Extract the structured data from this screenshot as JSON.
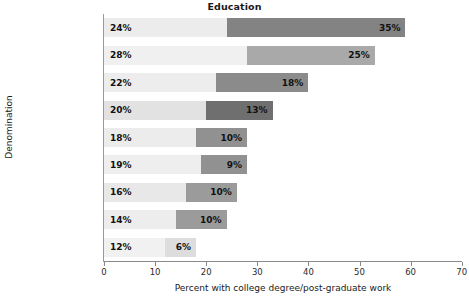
{
  "chart_data": {
    "type": "bar",
    "subtype": "stacked-horizontal",
    "title": "Education",
    "xlabel": "Percent with college degree/post-graduate work",
    "ylabel": "Denomination",
    "xlim": [
      0,
      70
    ],
    "xticks": [
      0,
      10,
      20,
      30,
      40,
      50,
      60,
      70
    ],
    "xtick_labels": [
      "0",
      "10",
      "20",
      "30",
      "40",
      "50",
      "60",
      "70"
    ],
    "grid": false,
    "legend": "none",
    "categories": [
      "Jewish",
      "Episcopalian",
      "Presbyterian",
      "Methodist",
      "Mormon",
      "Lutheran",
      "Roman Catholic",
      "Muslim",
      "Baptist"
    ],
    "series": [
      {
        "name": "College degree",
        "values": [
          24,
          28,
          22,
          20,
          18,
          19,
          16,
          14,
          12
        ],
        "labels": [
          "24%",
          "28%",
          "22%",
          "20%",
          "18%",
          "19%",
          "16%",
          "14%",
          "12%"
        ]
      },
      {
        "name": "Post-graduate work",
        "values": [
          35,
          25,
          18,
          13,
          10,
          9,
          10,
          10,
          6
        ],
        "labels": [
          "35%",
          "25%",
          "18%",
          "13%",
          "10%",
          "9%",
          "10%",
          "10%",
          "6%"
        ]
      }
    ],
    "totals": [
      59,
      53,
      40,
      33,
      28,
      28,
      26,
      24,
      18
    ],
    "rows": [
      {
        "category": "Jewish",
        "v1": 24,
        "l1": "24%",
        "v2": 35,
        "l2": "35%",
        "c1": "#ececec",
        "c2": "#838383"
      },
      {
        "category": "Episcopalian",
        "v1": 28,
        "l1": "28%",
        "v2": 25,
        "l2": "25%",
        "c1": "#f0f0f0",
        "c2": "#a9a9a9"
      },
      {
        "category": "Presbyterian",
        "v1": 22,
        "l1": "22%",
        "v2": 18,
        "l2": "18%",
        "c1": "#ededed",
        "c2": "#8b8b8b"
      },
      {
        "category": "Methodist",
        "v1": 20,
        "l1": "20%",
        "v2": 13,
        "l2": "13%",
        "c1": "#e2e2e2",
        "c2": "#6f6f6f"
      },
      {
        "category": "Mormon",
        "v1": 18,
        "l1": "18%",
        "v2": 10,
        "l2": "10%",
        "c1": "#ececec",
        "c2": "#919191"
      },
      {
        "category": "Lutheran",
        "v1": 19,
        "l1": "19%",
        "v2": 9,
        "l2": "9%",
        "c1": "#eeeeee",
        "c2": "#919191"
      },
      {
        "category": "Roman Catholic",
        "v1": 16,
        "l1": "16%",
        "v2": 10,
        "l2": "10%",
        "c1": "#e8e8e8",
        "c2": "#9b9b9b"
      },
      {
        "category": "Muslim",
        "v1": 14,
        "l1": "14%",
        "v2": 10,
        "l2": "10%",
        "c1": "#ededed",
        "c2": "#9b9b9b"
      },
      {
        "category": "Baptist",
        "v1": 12,
        "l1": "12%",
        "v2": 6,
        "l2": "6%",
        "c1": "#f1f1f1",
        "c2": "#dddddd"
      }
    ]
  },
  "colors": {
    "axis": "#8a8a8a",
    "text": "#1a1a1a",
    "value_text": "#111111"
  }
}
